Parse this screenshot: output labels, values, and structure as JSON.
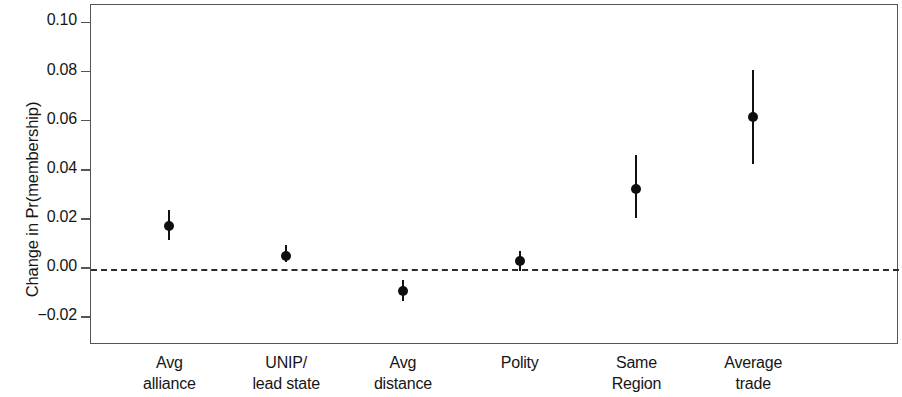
{
  "chart_data": {
    "type": "scatter",
    "title": "",
    "subtitle": "",
    "xlabel": "",
    "ylabel": "Change in Pr(membership)",
    "categories": [
      "Avg alliance",
      "UNIP/ lead state",
      "Avg distance",
      "Polity",
      "Same Region",
      "Average trade"
    ],
    "category_lines": [
      [
        "Avg",
        "alliance"
      ],
      [
        "UNIP/",
        "lead state"
      ],
      [
        "Avg",
        "distance"
      ],
      [
        "Polity",
        ""
      ],
      [
        "Same",
        "Region"
      ],
      [
        "Average",
        "trade"
      ]
    ],
    "values": [
      0.017,
      0.005,
      -0.0095,
      0.0028,
      0.0322,
      0.0614
    ],
    "ci_lower": [
      0.0115,
      0.0023,
      -0.0133,
      -0.0012,
      0.0203,
      0.0425
    ],
    "ci_upper": [
      0.0235,
      0.0092,
      -0.0048,
      0.0068,
      0.046,
      0.0808
    ],
    "ylim": [
      -0.031,
      0.1075
    ],
    "yticks": [
      0.1,
      0.08,
      0.06,
      0.04,
      0.02,
      0.0,
      -0.02
    ],
    "ytick_labels": [
      "0.10",
      "0.08",
      "0.06",
      "0.04",
      "0.02",
      "0.00",
      "−0.02"
    ],
    "reference_line": 0.0,
    "reference_line_style": "dashed",
    "grid": false,
    "legend": "none",
    "marker": "filled-circle",
    "errorbar_style": "vertical-line",
    "colors": {
      "marker": "#0f0f0f",
      "errorbar": "#111111",
      "reference_line": "#2b2b2b",
      "frame": "#555555",
      "text": "#161616",
      "background": "#ffffff"
    }
  }
}
